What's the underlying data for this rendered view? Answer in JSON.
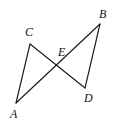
{
  "figure": {
    "background_color": "#ffffff",
    "line_color": "#1a1a1a",
    "label_color": "#141414",
    "canvas": {
      "width": 114,
      "height": 127
    },
    "points": [
      {
        "id": "A",
        "label": "A",
        "x": 16,
        "y": 103,
        "label_x": 14,
        "label_y": 116
      },
      {
        "id": "B",
        "label": "B",
        "x": 100,
        "y": 24,
        "label_x": 104,
        "label_y": 15
      },
      {
        "id": "C",
        "label": "C",
        "x": 30,
        "y": 44,
        "label_x": 29,
        "label_y": 33
      },
      {
        "id": "D",
        "label": "D",
        "x": 85,
        "y": 88,
        "label_x": 89,
        "label_y": 99
      },
      {
        "id": "E",
        "label": "E",
        "x": 61,
        "y": 65,
        "label_x": 62,
        "label_y": 53
      }
    ],
    "segments": [
      {
        "id": "AC",
        "from": "A",
        "to": "C",
        "path": "M 16 103 L 30 44"
      },
      {
        "id": "CD",
        "from": "C",
        "to": "D",
        "path": "M 30 44 L 85 88"
      },
      {
        "id": "AB",
        "from": "A",
        "to": "B",
        "path": "M 16 103 L 100 24"
      },
      {
        "id": "BD",
        "from": "B",
        "to": "D",
        "path": "M 100 24 L 85 88"
      }
    ]
  }
}
